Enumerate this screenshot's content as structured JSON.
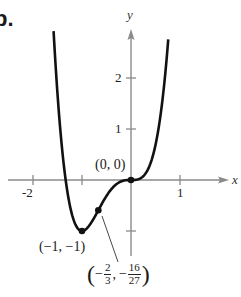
{
  "part_label": "b.",
  "chart_data": {
    "type": "line",
    "title": "",
    "function": "f(x) = 3x^4 + 4x^3",
    "xlabel": "x",
    "ylabel": "y",
    "xlim": [
      -2.5,
      2.0
    ],
    "ylim": [
      -1.45,
      2.95
    ],
    "grid": false,
    "x_ticks": [
      -2,
      -1,
      1
    ],
    "x_tick_labels": [
      "-2",
      "",
      "1"
    ],
    "y_ticks": [
      2,
      1,
      -1
    ],
    "y_tick_labels": [
      "2",
      "1",
      ""
    ],
    "series": [
      {
        "name": "f(x)",
        "x": [
          -1.58,
          -1.5,
          -1.4,
          -1.3,
          -1.2,
          -1.1,
          -1.0,
          -0.9,
          -0.8,
          -0.667,
          -0.6,
          -0.5,
          -0.4,
          -0.3,
          -0.2,
          -0.1,
          0.0,
          0.1,
          0.2,
          0.3,
          0.4,
          0.5,
          0.6,
          0.7,
          0.76
        ],
        "y": [
          2.71,
          1.69,
          0.55,
          -0.22,
          -0.69,
          -0.93,
          -1.0,
          -0.95,
          -0.82,
          -0.593,
          -0.47,
          -0.31,
          -0.18,
          -0.08,
          -0.03,
          -0.004,
          0.0,
          0.004,
          0.04,
          0.13,
          0.33,
          0.69,
          1.25,
          2.09,
          2.76
        ]
      }
    ],
    "points": [
      {
        "x": -1,
        "y": -1,
        "label": "(−1, −1)"
      },
      {
        "x": -0.6667,
        "y": -0.5926,
        "label": "(−2/3, −16/27)"
      },
      {
        "x": 0,
        "y": 0,
        "label": "(0, 0)"
      }
    ],
    "annotations": {
      "origin": "(0, 0)",
      "minimum": "(−1, −1)",
      "inflection": {
        "open": "(",
        "neg": "−",
        "x_num": "2",
        "x_den": "3",
        "sep": ",",
        "y_num": "16",
        "y_den": "27",
        "close": ")"
      }
    }
  },
  "colors": {
    "curve": "#111111",
    "axis": "#8a8a8a",
    "text": "#1a1a1a"
  }
}
